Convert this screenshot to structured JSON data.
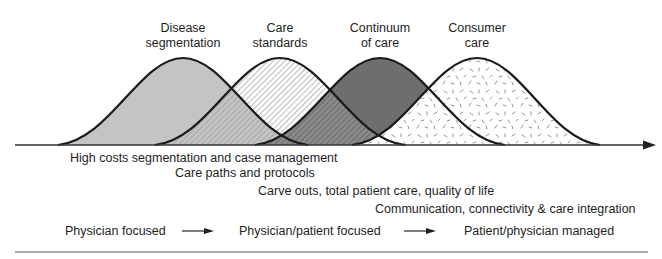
{
  "diagram": {
    "curves": [
      {
        "id": "disease-segmentation",
        "label_lines": [
          "Disease",
          "segmentation"
        ],
        "peak_x": 183,
        "fill": "#c4c4c4",
        "pattern": "solid-light-gray"
      },
      {
        "id": "care-standards",
        "label_lines": [
          "Care",
          "standards"
        ],
        "peak_x": 280,
        "fill": "#ffffff",
        "pattern": "diagonal-hatch"
      },
      {
        "id": "continuum-of-care",
        "label_lines": [
          "Continuum",
          "of care"
        ],
        "peak_x": 380,
        "fill": "#6e6e6e",
        "pattern": "solid-dark-gray"
      },
      {
        "id": "consumer-care",
        "label_lines": [
          "Consumer",
          "care"
        ],
        "peak_x": 477,
        "fill": "#ffffff",
        "pattern": "random-dashes"
      }
    ],
    "descriptions": [
      "High costs segmentation and case management",
      "Care paths and protocols",
      "Carve outs, total patient care, quality of life",
      "Communication, connectivity & care integration"
    ],
    "progression": {
      "stages": [
        "Physician focused",
        "Physician/patient focused",
        "Patient/physician managed"
      ],
      "arrow_icon": "right-arrow"
    },
    "colors": {
      "outline": "#1a1a1a",
      "axis": "#333333",
      "light_fill": "#c4c4c4",
      "dark_fill": "#6e6e6e"
    }
  }
}
